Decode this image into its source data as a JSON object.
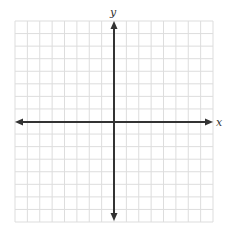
{
  "diagram": {
    "type": "coordinate-plane",
    "x_axis_label": "x",
    "y_axis_label": "y",
    "grid": {
      "columns": 16,
      "rows": 16,
      "left": 15,
      "top": 21,
      "right": 213,
      "bottom": 222,
      "line_color": "#dddddd"
    },
    "origin": {
      "x": 114,
      "y": 122
    },
    "axis_color": "#333333",
    "arrows": [
      "left",
      "right",
      "up",
      "down"
    ]
  }
}
